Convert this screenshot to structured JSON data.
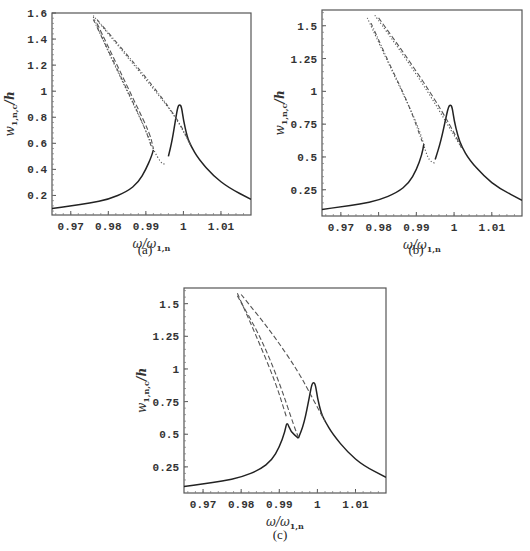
{
  "chart_data": [
    {
      "id": "a",
      "type": "line",
      "caption": "(a)",
      "xlabel": "ω/ω1,n",
      "ylabel": "w1,n,c/h",
      "xlim": [
        0.965,
        1.018
      ],
      "ylim": [
        0.05,
        1.6
      ],
      "xticks": [
        0.97,
        0.98,
        0.99,
        1,
        1.01
      ],
      "xtick_labels": [
        "0.97",
        "0.98",
        "0.99",
        "1",
        "1.01"
      ],
      "yticks": [
        0.2,
        0.4,
        0.6,
        0.8,
        1.0,
        1.2,
        1.4,
        1.6
      ],
      "ytick_labels": [
        "0.2",
        "0.4",
        "0.6",
        "0.8",
        "1",
        "1.2",
        "1.4",
        "1.6"
      ],
      "frame_px": {
        "left": 52,
        "top": 13,
        "right": 251,
        "bottom": 215
      },
      "series": [
        {
          "name": "stable response (solid)",
          "style": "solid",
          "x": [
            0.965,
            0.97,
            0.975,
            0.98,
            0.985,
            0.988,
            0.99,
            0.9915,
            0.992
          ],
          "y": [
            0.1,
            0.12,
            0.14,
            0.17,
            0.23,
            0.3,
            0.4,
            0.5,
            0.55
          ]
        },
        {
          "name": "stable response right branch (solid)",
          "style": "solid",
          "x": [
            0.996,
            0.997,
            0.998,
            0.9985,
            0.999,
            0.9995,
            1.0,
            1.001,
            1.002,
            1.004,
            1.008,
            1.012,
            1.018
          ],
          "y": [
            0.5,
            0.62,
            0.8,
            0.88,
            0.9,
            0.88,
            0.78,
            0.65,
            0.58,
            0.48,
            0.35,
            0.26,
            0.17
          ]
        },
        {
          "name": "unstable branch 1",
          "style": "dotted",
          "x": [
            0.976,
            0.98,
            0.985,
            0.99,
            0.992,
            0.994,
            0.995
          ],
          "y": [
            1.57,
            1.3,
            1.0,
            0.7,
            0.55,
            0.45,
            0.44
          ]
        },
        {
          "name": "unstable branch 2",
          "style": "dotdash",
          "x": [
            0.976,
            0.981,
            0.986,
            0.99,
            0.9915
          ],
          "y": [
            1.55,
            1.25,
            0.95,
            0.7,
            0.57
          ]
        },
        {
          "name": "unstable branch 3",
          "style": "dashed",
          "x": [
            0.977,
            0.982,
            0.987,
            0.991,
            0.992
          ],
          "y": [
            1.52,
            1.22,
            0.92,
            0.68,
            0.56
          ]
        },
        {
          "name": "unstable branch 4",
          "style": "dotted",
          "x": [
            0.976,
            0.984,
            0.992,
            0.998,
            1.002
          ],
          "y": [
            1.58,
            1.3,
            1.02,
            0.8,
            0.58
          ]
        },
        {
          "name": "unstable branch 5",
          "style": "dotdash",
          "x": [
            0.977,
            0.985,
            0.993,
            0.999,
            1.002
          ],
          "y": [
            1.55,
            1.28,
            1.0,
            0.76,
            0.58
          ]
        }
      ]
    },
    {
      "id": "b",
      "type": "line",
      "caption": "(b)",
      "xlabel": "ω/ω1,n",
      "ylabel": "w1,n,c/h",
      "xlim": [
        0.965,
        1.018
      ],
      "ylim": [
        0.05,
        1.62
      ],
      "xticks": [
        0.97,
        0.98,
        0.99,
        1,
        1.01
      ],
      "xtick_labels": [
        "0.97",
        "0.98",
        "0.99",
        "1",
        "1.01"
      ],
      "yticks": [
        0.25,
        0.5,
        0.75,
        1.0,
        1.25,
        1.5
      ],
      "ytick_labels": [
        "0.25",
        "0.5",
        "0.75",
        "1",
        "1.25",
        "1.5"
      ],
      "frame_px": {
        "left": 322,
        "top": 10,
        "right": 522,
        "bottom": 216
      },
      "series": [
        {
          "name": "stable response (solid)",
          "style": "solid",
          "x": [
            0.965,
            0.97,
            0.975,
            0.98,
            0.985,
            0.988,
            0.99,
            0.9915,
            0.992
          ],
          "y": [
            0.1,
            0.12,
            0.14,
            0.17,
            0.23,
            0.3,
            0.4,
            0.52,
            0.6
          ]
        },
        {
          "name": "stable response right branch (solid)",
          "style": "solid",
          "x": [
            0.995,
            0.9965,
            0.998,
            0.9985,
            0.999,
            0.9995,
            1.0,
            1.001,
            1.002,
            1.004,
            1.008,
            1.012,
            1.018
          ],
          "y": [
            0.48,
            0.62,
            0.82,
            0.88,
            0.9,
            0.88,
            0.78,
            0.66,
            0.58,
            0.48,
            0.35,
            0.26,
            0.17
          ]
        },
        {
          "name": "unstable branch 1",
          "style": "dotted",
          "x": [
            0.977,
            0.982,
            0.987,
            0.991,
            0.993,
            0.995
          ],
          "y": [
            1.56,
            1.25,
            0.95,
            0.7,
            0.48,
            0.45
          ]
        },
        {
          "name": "unstable branch 2",
          "style": "dotdash",
          "x": [
            0.978,
            0.983,
            0.988,
            0.9915
          ],
          "y": [
            1.52,
            1.2,
            0.9,
            0.62
          ]
        },
        {
          "name": "unstable branch 3",
          "style": "dotted",
          "x": [
            0.979,
            0.986,
            0.993,
            0.998,
            1.002
          ],
          "y": [
            1.58,
            1.3,
            1.0,
            0.76,
            0.57
          ]
        },
        {
          "name": "unstable branch 4",
          "style": "dashed",
          "x": [
            0.98,
            0.987,
            0.994,
            0.999,
            1.002
          ],
          "y": [
            1.56,
            1.28,
            0.98,
            0.74,
            0.57
          ]
        }
      ]
    },
    {
      "id": "c",
      "type": "line",
      "caption": "(c)",
      "xlabel": "ω/ω1,n",
      "ylabel": "w1,n,c/h",
      "xlim": [
        0.965,
        1.018
      ],
      "ylim": [
        0.05,
        1.62
      ],
      "xticks": [
        0.97,
        0.98,
        0.99,
        1,
        1.01
      ],
      "xtick_labels": [
        "0.97",
        "0.98",
        "0.99",
        "1",
        "1.01"
      ],
      "yticks": [
        0.25,
        0.5,
        0.75,
        1.0,
        1.25,
        1.5
      ],
      "ytick_labels": [
        "0.25",
        "0.5",
        "0.75",
        "1",
        "1.25",
        "1.5"
      ],
      "frame_px": {
        "left": 184,
        "top": 288,
        "right": 386,
        "bottom": 493
      },
      "series": [
        {
          "name": "stable response (solid)",
          "style": "solid",
          "x": [
            0.965,
            0.97,
            0.975,
            0.98,
            0.985,
            0.988,
            0.99,
            0.9915,
            0.992,
            0.993,
            0.995
          ],
          "y": [
            0.1,
            0.12,
            0.14,
            0.17,
            0.23,
            0.3,
            0.4,
            0.52,
            0.6,
            0.52,
            0.47
          ]
        },
        {
          "name": "stable response right branch (solid)",
          "style": "solid",
          "x": [
            0.995,
            0.9965,
            0.998,
            0.9985,
            0.999,
            0.9995,
            1.0,
            1.001,
            1.002,
            1.004,
            1.008,
            1.012,
            1.018
          ],
          "y": [
            0.47,
            0.58,
            0.8,
            0.88,
            0.9,
            0.88,
            0.78,
            0.66,
            0.6,
            0.5,
            0.36,
            0.26,
            0.17
          ]
        },
        {
          "name": "unstable branch 1",
          "style": "dashed",
          "x": [
            0.979,
            0.984,
            0.989,
            0.992
          ],
          "y": [
            1.58,
            1.25,
            0.9,
            0.62
          ]
        },
        {
          "name": "unstable branch 2",
          "style": "dashed",
          "x": [
            0.979,
            0.985,
            0.99,
            0.994,
            0.995
          ],
          "y": [
            1.56,
            1.25,
            0.9,
            0.55,
            0.48
          ]
        },
        {
          "name": "unstable branch 3",
          "style": "dashed",
          "x": [
            0.98,
            0.988,
            0.995,
            0.999,
            1.002
          ],
          "y": [
            1.57,
            1.28,
            0.98,
            0.76,
            0.6
          ]
        }
      ]
    }
  ],
  "panels": {
    "a": {
      "caption": "(a)"
    },
    "b": {
      "caption": "(b)"
    },
    "c": {
      "caption": "(c)"
    }
  }
}
